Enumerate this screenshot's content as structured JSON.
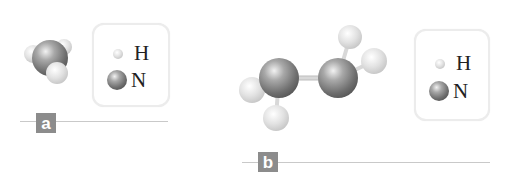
{
  "panels": [
    {
      "tag": "a",
      "molecule": "ammonia (space-filling)",
      "legend": [
        {
          "symbol": "H",
          "atom": "hydrogen",
          "color": "#d9d9d9"
        },
        {
          "symbol": "N",
          "atom": "nitrogen",
          "color": "#808080"
        }
      ]
    },
    {
      "tag": "b",
      "molecule": "hydrazine (ball-and-stick)",
      "legend": [
        {
          "symbol": "H",
          "atom": "hydrogen",
          "color": "#d9d9d9"
        },
        {
          "symbol": "N",
          "atom": "nitrogen",
          "color": "#808080"
        }
      ]
    }
  ],
  "colors": {
    "tag_bg": "#8c8c8c",
    "rule_line": "#c9c9c9",
    "legend_border": "#ececec"
  }
}
